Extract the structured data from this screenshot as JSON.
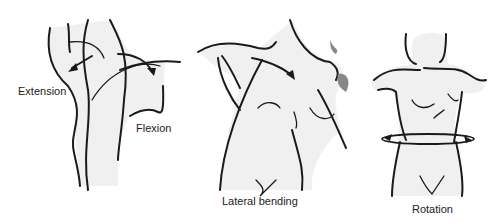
{
  "figure": {
    "panels": [
      {
        "id": "flexion-extension",
        "labels": [
          "Extension",
          "Flexion"
        ]
      },
      {
        "id": "lateral-bending",
        "labels": [
          "Lateral bending"
        ]
      },
      {
        "id": "rotation",
        "labels": [
          "Rotation"
        ]
      }
    ]
  },
  "labels": {
    "extension": "Extension",
    "flexion": "Flexion",
    "lateral_bending": "Lateral bending",
    "rotation": "Rotation"
  }
}
